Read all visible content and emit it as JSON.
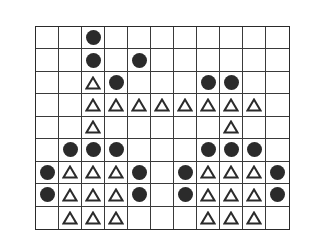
{
  "board": {
    "rows": 9,
    "cols": 11,
    "legend": {
      "O": "filled-circle",
      "T": "triangle-outline",
      ".": "empty"
    },
    "cells": [
      "..O........",
      "..O.O......",
      "..TO...OO..",
      "..TTTTTTTT.",
      "..T.....T..",
      ".OOO...OOO.",
      "OTTTO.OTTTO",
      "OTTTO.OTTTO",
      ".TTT...TTT."
    ]
  },
  "colors": {
    "line": "#3a3a3a",
    "piece": "#2b2b2b",
    "background": "#ffffff"
  }
}
